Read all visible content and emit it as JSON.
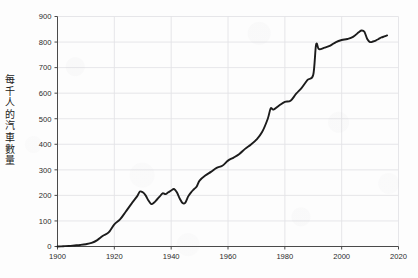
{
  "chart_data": {
    "type": "line",
    "title": "",
    "subtitle": "",
    "xlabel": "",
    "ylabel": "每千人的汽車數量",
    "ylabel_chars": [
      "每",
      "千",
      "人",
      "的",
      "汽",
      "車",
      "數",
      "量"
    ],
    "xlim": [
      1900,
      2020
    ],
    "ylim": [
      0,
      900
    ],
    "xticks": [
      1900,
      1920,
      1940,
      1960,
      1980,
      2000,
      2020
    ],
    "xtick_labels": [
      "1900",
      "1920",
      "1940",
      "1960",
      "1980",
      "2000",
      "2020"
    ],
    "yticks": [
      0,
      100,
      200,
      300,
      400,
      500,
      600,
      700,
      800,
      900
    ],
    "ytick_labels": [
      "0",
      "100",
      "200",
      "300",
      "400",
      "500",
      "600",
      "700",
      "800",
      "900"
    ],
    "grid": true,
    "grid_color": "#e3e3e6",
    "legend": null,
    "legend_position": "none",
    "line_color": "#1c1c1c",
    "line_width": 1.9,
    "series": [
      {
        "name": "每千人的汽車數量",
        "x": [
          1900,
          1902,
          1904,
          1906,
          1908,
          1910,
          1912,
          1914,
          1916,
          1918,
          1920,
          1922,
          1924,
          1926,
          1928,
          1929,
          1930,
          1931,
          1932,
          1933,
          1934,
          1935,
          1936,
          1937,
          1938,
          1939,
          1940,
          1941,
          1942,
          1943,
          1944,
          1945,
          1946,
          1947,
          1948,
          1949,
          1950,
          1952,
          1954,
          1956,
          1958,
          1960,
          1962,
          1964,
          1966,
          1968,
          1970,
          1972,
          1974,
          1975,
          1976,
          1978,
          1980,
          1982,
          1984,
          1986,
          1988,
          1990,
          1991,
          1992,
          1994,
          1996,
          1998,
          2000,
          2002,
          2004,
          2006,
          2007,
          2008,
          2009,
          2010,
          2011,
          2012,
          2013,
          2014,
          2015,
          2016
        ],
        "y": [
          0,
          1,
          2,
          4,
          6,
          9,
          14,
          25,
          42,
          55,
          87,
          106,
          136,
          167,
          196,
          215,
          212,
          200,
          180,
          166,
          172,
          184,
          196,
          208,
          205,
          212,
          219,
          225,
          212,
          188,
          170,
          172,
          196,
          212,
          224,
          235,
          258,
          278,
          292,
          308,
          316,
          336,
          348,
          362,
          382,
          398,
          418,
          448,
          500,
          540,
          536,
          552,
          566,
          570,
          598,
          622,
          652,
          672,
          790,
          772,
          778,
          786,
          800,
          808,
          812,
          820,
          838,
          845,
          840,
          812,
          800,
          802,
          806,
          812,
          818,
          822,
          826
        ],
        "color": "#1c1c1c"
      }
    ]
  },
  "axes": {
    "y_axis_name": "y-axis",
    "x_axis_name": "x-axis"
  }
}
